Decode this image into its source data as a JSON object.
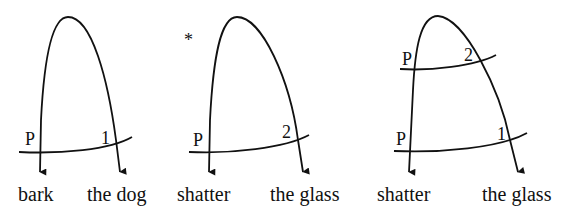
{
  "diagrams": [
    {
      "id": "d1",
      "grammatical": true,
      "words": {
        "left": "bark",
        "right": "the dog"
      },
      "strata": [
        {
          "left_label": "P",
          "right_label": "1"
        }
      ]
    },
    {
      "id": "d2",
      "grammatical": false,
      "ungrammatical_mark": "*",
      "words": {
        "left": "shatter",
        "right": "the glass"
      },
      "strata": [
        {
          "left_label": "P",
          "right_label": "2"
        }
      ]
    },
    {
      "id": "d3",
      "grammatical": true,
      "words": {
        "left": "shatter",
        "right": "the glass"
      },
      "strata": [
        {
          "left_label": "P",
          "right_label": "2"
        },
        {
          "left_label": "P",
          "right_label": "1"
        }
      ]
    }
  ],
  "colors": {
    "ink": "#111111",
    "background": "#ffffff"
  }
}
